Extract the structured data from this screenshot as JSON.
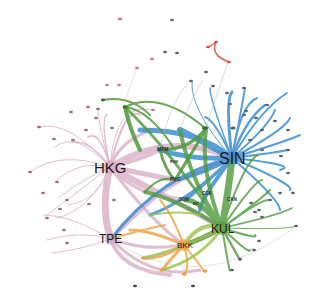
{
  "diagram": {
    "type": "network-graph",
    "colors": {
      "pink": "#d4a5c0",
      "blue": "#3c8fd4",
      "green": "#4f9a3c",
      "orange": "#f0a040",
      "lightgreen": "#9ac24a",
      "red": "#e05040",
      "node": "#2f4f4f"
    },
    "hubs": [
      {
        "id": "HKG",
        "label": "HKG",
        "x": 110,
        "y": 167,
        "size": 13,
        "color": "#d4a5c0"
      },
      {
        "id": "SIN",
        "label": "SIN",
        "x": 232,
        "y": 158,
        "size": 13,
        "color": "#3c8fd4"
      },
      {
        "id": "TPE",
        "label": "TPE",
        "x": 111,
        "y": 239,
        "size": 11,
        "color": "#d4a5c0"
      },
      {
        "id": "KUL",
        "label": "KUL",
        "x": 222,
        "y": 228,
        "size": 11,
        "color": "#4f9a3c"
      },
      {
        "id": "BKK",
        "label": "BKK",
        "x": 184,
        "y": 245,
        "size": 8,
        "color": "#f0a040"
      }
    ],
    "minor_labels": [
      {
        "label": "MFM",
        "x": 163,
        "y": 150
      },
      {
        "label": "PVG",
        "x": 174,
        "y": 177
      },
      {
        "label": "SGN",
        "x": 186,
        "y": 199
      },
      {
        "label": "CGK",
        "x": 204,
        "y": 193
      },
      {
        "label": "CAN",
        "x": 231,
        "y": 199
      },
      {
        "label": "BKI",
        "x": 197,
        "y": 203
      },
      {
        "label": "RGN",
        "x": 174,
        "y": 162
      }
    ]
  }
}
